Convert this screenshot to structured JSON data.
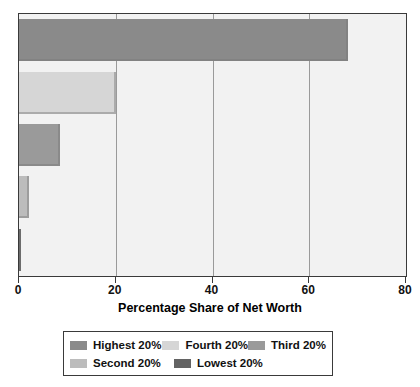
{
  "chart_data": {
    "type": "bar",
    "orientation": "horizontal",
    "title": "",
    "xlabel": "Percentage Share of Net Worth",
    "ylabel": "",
    "xlim": [
      0,
      80
    ],
    "xticks": [
      0,
      20,
      40,
      60,
      80
    ],
    "xtick_labels": [
      "0",
      "20",
      "40",
      "60",
      "80"
    ],
    "grid": true,
    "grid_axis": "x",
    "legend_position": "bottom",
    "categories": [
      "Highest 20%",
      "Fourth 20%",
      "Third 20%",
      "Second 20%",
      "Lowest 20%"
    ],
    "values": [
      68,
      20,
      8.4,
      2,
      0.5
    ],
    "series": [
      {
        "name": "Highest 20%",
        "value": 68,
        "color": "#8a8a8a"
      },
      {
        "name": "Fourth 20%",
        "value": 20,
        "color": "#d6d6d6"
      },
      {
        "name": "Third 20%",
        "value": 8.4,
        "color": "#9a9a9a"
      },
      {
        "name": "Second 20%",
        "value": 2,
        "color": "#bcbcbc"
      },
      {
        "name": "Lowest 20%",
        "value": 0.5,
        "color": "#636363"
      }
    ]
  },
  "axis": {
    "title": "Percentage Share of Net Worth",
    "ticks": [
      {
        "label": "0",
        "value": 0
      },
      {
        "label": "20",
        "value": 20
      },
      {
        "label": "40",
        "value": 40
      },
      {
        "label": "60",
        "value": 60
      },
      {
        "label": "80",
        "value": 80
      }
    ]
  },
  "legend": {
    "rows": [
      [
        {
          "label": "Highest 20%",
          "color": "#8a8a8a"
        },
        {
          "label": "Fourth 20%",
          "color": "#d6d6d6"
        },
        {
          "label": "Third 20%",
          "color": "#9a9a9a"
        }
      ],
      [
        {
          "label": "Second 20%",
          "color": "#bcbcbc"
        },
        {
          "label": "Lowest 20%",
          "color": "#636363"
        }
      ]
    ]
  },
  "colors": {
    "plot_background": "#f2f2f2",
    "frame": "#3a3a3a",
    "gridline": "#9a9a9a",
    "text": "#111111"
  }
}
